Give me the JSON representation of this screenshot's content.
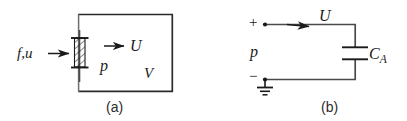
{
  "figure": {
    "width": 407,
    "height": 121,
    "background": "#ffffff",
    "ink_color": "#1a1a1a",
    "panels": [
      {
        "id": "a",
        "caption": "(a)",
        "description": "gas-filled cylinder with movable piston",
        "labels": {
          "force_velocity": "f,u",
          "piston_velocity": "U",
          "pressure": "p",
          "volume": "V"
        }
      },
      {
        "id": "b",
        "caption": "(b)",
        "description": "equivalent electrical circuit with capacitor and ground",
        "labels": {
          "voltage": "U",
          "pressure": "p",
          "capacitor": "C",
          "capacitor_subscript": "A",
          "terminal_positive": "+",
          "terminal_negative": "−"
        }
      }
    ]
  }
}
